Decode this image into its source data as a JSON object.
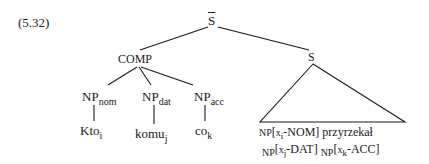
{
  "example_number": "(5.32)",
  "root": {
    "label": "S",
    "bar": true
  },
  "comp": {
    "label": "COMP"
  },
  "s_node": {
    "label": "S"
  },
  "np_nodes": [
    {
      "base": "NP",
      "case": "nom",
      "word": "Kto",
      "index": "i"
    },
    {
      "base": "NP",
      "case": "dat",
      "word": "komu",
      "index": "j"
    },
    {
      "base": "NP",
      "case": "acc",
      "word": "co",
      "index": "k"
    }
  ],
  "triangle_text": {
    "line1": [
      {
        "np": "NP",
        "var": "x",
        "index": "i",
        "case": "-NOM]"
      },
      {
        "word": "przyrzekał"
      }
    ],
    "line2": [
      {
        "np": "NP",
        "var": "x",
        "index": "j",
        "case": "-DAT]"
      },
      {
        "np": "NP",
        "var": "x",
        "index": "k",
        "case": "-ACC]"
      }
    ],
    "bracket_open": "["
  },
  "line_color": "#1a1a1a"
}
